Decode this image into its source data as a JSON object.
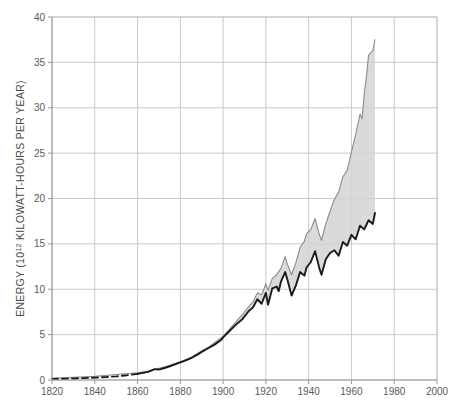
{
  "chart_data": {
    "type": "line",
    "title": "",
    "subtitle": "",
    "xlabel": "",
    "ylabel": "ENERGY (10^12 KILOWATT-HOURS PER YEAR)",
    "ylabel_prefix": "ENERGY (10",
    "ylabel_exponent": "12",
    "ylabel_suffix": " KILOWATT-HOURS PER YEAR)",
    "xlim": [
      1820,
      2000
    ],
    "ylim": [
      0,
      40
    ],
    "xticks": [
      1820,
      1840,
      1860,
      1880,
      1900,
      1920,
      1940,
      1960,
      1980,
      2000
    ],
    "yticks": [
      0,
      5,
      10,
      15,
      20,
      25,
      30,
      35,
      40
    ],
    "xtick_labels": [
      "1820",
      "1840",
      "1860",
      "1880",
      "1900",
      "1920",
      "1940",
      "1960",
      "1980",
      "2000"
    ],
    "ytick_labels": [
      "0",
      "5",
      "10",
      "15",
      "20",
      "25",
      "30",
      "35",
      "40"
    ],
    "grid": true,
    "grid_color": "#bcbcbc",
    "legend": "none",
    "band_fill": "#d4d4d4",
    "line_color": "#1a1a1a",
    "upper_line_color": "#8c8c8c",
    "series": [
      {
        "name": "Total energy (upper estimate)",
        "style": "solid",
        "color": "#8c8c8c",
        "x": [
          1820,
          1830,
          1840,
          1850,
          1860,
          1865,
          1870,
          1875,
          1880,
          1885,
          1890,
          1893,
          1896,
          1900,
          1903,
          1906,
          1909,
          1912,
          1914,
          1916,
          1918,
          1920,
          1921,
          1923,
          1925,
          1927,
          1929,
          1930,
          1932,
          1934,
          1936,
          1938,
          1939,
          1941,
          1943,
          1945,
          1946,
          1948,
          1950,
          1952,
          1954,
          1956,
          1958,
          1960,
          1962,
          1964,
          1965,
          1966,
          1967,
          1968,
          1970,
          1971
        ],
        "y": [
          0.2,
          0.3,
          0.4,
          0.6,
          0.8,
          1.0,
          1.3,
          1.6,
          2.0,
          2.5,
          3.2,
          3.6,
          4.1,
          4.8,
          5.6,
          6.4,
          7.2,
          8.1,
          8.6,
          9.6,
          9.4,
          10.6,
          9.9,
          11.2,
          11.6,
          12.3,
          13.6,
          12.8,
          11.6,
          12.9,
          14.6,
          15.3,
          16.1,
          16.6,
          17.8,
          16.0,
          15.4,
          17.2,
          18.6,
          19.9,
          20.7,
          22.4,
          23.1,
          25.1,
          27.1,
          29.3,
          28.8,
          31.6,
          33.4,
          35.8,
          36.3,
          37.5
        ]
      },
      {
        "name": "Commercial energy (dashed early record)",
        "style": "dashed",
        "color": "#1a1a1a",
        "x": [
          1820,
          1825,
          1830,
          1835,
          1840,
          1845,
          1850,
          1855,
          1860
        ],
        "y": [
          0.12,
          0.14,
          0.17,
          0.21,
          0.26,
          0.32,
          0.4,
          0.52,
          0.68
        ]
      },
      {
        "name": "Commercial energy",
        "style": "solid",
        "color": "#1a1a1a",
        "x": [
          1860,
          1865,
          1868,
          1870,
          1873,
          1876,
          1879,
          1882,
          1885,
          1888,
          1890,
          1893,
          1896,
          1899,
          1900,
          1903,
          1906,
          1909,
          1912,
          1914,
          1916,
          1918,
          1920,
          1921,
          1923,
          1925,
          1926,
          1927,
          1929,
          1930,
          1932,
          1934,
          1936,
          1938,
          1939,
          1941,
          1943,
          1945,
          1946,
          1948,
          1950,
          1952,
          1954,
          1956,
          1958,
          1960,
          1962,
          1964,
          1966,
          1968,
          1970,
          1971
        ],
        "y": [
          0.68,
          0.9,
          1.2,
          1.15,
          1.35,
          1.6,
          1.85,
          2.1,
          2.4,
          2.8,
          3.1,
          3.5,
          3.9,
          4.4,
          4.7,
          5.4,
          6.1,
          6.7,
          7.6,
          8.0,
          8.9,
          8.4,
          9.6,
          8.3,
          10.1,
          10.3,
          9.8,
          10.8,
          11.9,
          11.1,
          9.3,
          10.4,
          11.9,
          11.5,
          12.4,
          13.0,
          14.2,
          12.3,
          11.6,
          13.3,
          14.0,
          14.3,
          13.7,
          15.2,
          14.8,
          16.0,
          15.5,
          17.0,
          16.6,
          17.6,
          17.2,
          18.4
        ]
      }
    ],
    "annotations": [
      {
        "text": "Dashed segment indicates estimated record before 1860",
        "visible": false
      }
    ]
  },
  "figure": {
    "background_color": "#ffffff",
    "plot_left_px": 52,
    "plot_right_px": 437,
    "plot_top_px": 17,
    "plot_bottom_px": 380
  }
}
